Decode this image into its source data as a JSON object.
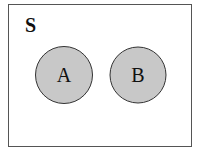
{
  "diagram": {
    "type": "venn",
    "universe": {
      "label": "S",
      "x": 8,
      "y": 4,
      "width": 183,
      "height": 142,
      "stroke": "#555555"
    },
    "sets": [
      {
        "label": "A",
        "cx": 64,
        "cy": 75,
        "r": 28.5,
        "fill": "#c8c8c8",
        "stroke": "#333333"
      },
      {
        "label": "B",
        "cx": 138,
        "cy": 75,
        "r": 28,
        "fill": "#c8c8c8",
        "stroke": "#333333"
      }
    ],
    "relation": "disjoint"
  }
}
